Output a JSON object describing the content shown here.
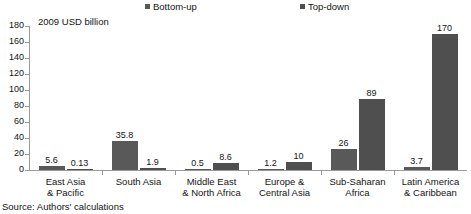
{
  "chart_data": {
    "type": "bar",
    "title": "",
    "ylabel": "2009 USD billion",
    "xlabel": "",
    "ylim": [
      0,
      180
    ],
    "yticks": [
      0,
      20,
      40,
      60,
      80,
      100,
      120,
      140,
      160,
      180
    ],
    "grid": false,
    "legend_position": "top",
    "categories": [
      "East Asia & Pacific",
      "South Asia",
      "Middle East & North Africa",
      "Europe & Central Asia",
      "Sub-Saharan Africa",
      "Latin America & Caribbean"
    ],
    "category_lines": [
      [
        "East Asia",
        "& Pacific"
      ],
      [
        "South Asia",
        ""
      ],
      [
        "Middle East",
        "& North Africa"
      ],
      [
        "Europe &",
        "Central Asia"
      ],
      [
        "Sub-Saharan",
        "Africa"
      ],
      [
        "Latin America",
        "& Caribbean"
      ]
    ],
    "series": [
      {
        "name": "Bottom-up",
        "color": "#595959",
        "values": [
          5.6,
          35.8,
          0.5,
          1.2,
          26,
          3.7
        ],
        "labels": [
          "5.6",
          "35.8",
          "0.5",
          "1.2",
          "26",
          "3.7"
        ]
      },
      {
        "name": "Top-down",
        "color": "#4f4f4f",
        "values": [
          0.13,
          1.9,
          8.6,
          10,
          89,
          170
        ],
        "labels": [
          "0.13",
          "1.9",
          "8.6",
          "10",
          "89",
          "170"
        ]
      }
    ]
  },
  "legend": {
    "entries": [
      {
        "label": "Bottom-up",
        "color": "#595959"
      },
      {
        "label": "Top-down",
        "color": "#4f4f4f"
      }
    ]
  },
  "axis": {
    "y_title": "2009 USD billion",
    "tick_labels": [
      "180",
      "160",
      "140",
      "120",
      "100",
      "80",
      "60",
      "40",
      "20",
      "0"
    ]
  },
  "footer": {
    "source_note": "Source: Authors' calculations"
  }
}
